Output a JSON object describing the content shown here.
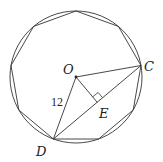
{
  "diagram": {
    "shape": "regular nonagon",
    "circle": {
      "cx": 76,
      "cy": 77,
      "r": 66
    },
    "polygon_points": "76,11 118.4,26.4 141,65.5 133.2,110 98.6,139 53.4,139 18.8,110 11,65.5 33.6,26.4",
    "points": {
      "O": {
        "label": "O",
        "x": 76,
        "y": 77
      },
      "C": {
        "label": "C",
        "x": 141,
        "y": 65.5
      },
      "D": {
        "label": "D",
        "x": 53.4,
        "y": 139
      },
      "E": {
        "label": "E",
        "x": 97.2,
        "y": 102.3
      }
    },
    "segments": [
      "OC",
      "OD",
      "CD",
      "OE"
    ],
    "measure_OD": "12",
    "right_angle_at": "E",
    "stroke_color": "#333333"
  }
}
